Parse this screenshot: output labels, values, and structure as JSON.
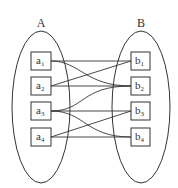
{
  "diagram": {
    "sets": [
      {
        "label": "A",
        "elements": [
          {
            "id": "a1",
            "base": "a",
            "sub": "1"
          },
          {
            "id": "a2",
            "base": "a",
            "sub": "2"
          },
          {
            "id": "a3",
            "base": "a",
            "sub": "3"
          },
          {
            "id": "a4",
            "base": "a",
            "sub": "4"
          }
        ]
      },
      {
        "label": "B",
        "elements": [
          {
            "id": "b1",
            "base": "b",
            "sub": "1"
          },
          {
            "id": "b2",
            "base": "b",
            "sub": "2"
          },
          {
            "id": "b3",
            "base": "b",
            "sub": "3"
          },
          {
            "id": "b4",
            "base": "b",
            "sub": "4"
          }
        ]
      }
    ],
    "connections": [
      {
        "from": "a1",
        "to": "b1"
      },
      {
        "from": "a1",
        "to": "b2"
      },
      {
        "from": "a2",
        "to": "b1"
      },
      {
        "from": "a2",
        "to": "b2"
      },
      {
        "from": "a3",
        "to": "b2"
      },
      {
        "from": "a3",
        "to": "b3"
      },
      {
        "from": "a3",
        "to": "b4"
      },
      {
        "from": "a4",
        "to": "b3"
      },
      {
        "from": "a4",
        "to": "b4"
      }
    ],
    "colors": {
      "stroke": "#333333",
      "background": "#ffffff"
    }
  }
}
